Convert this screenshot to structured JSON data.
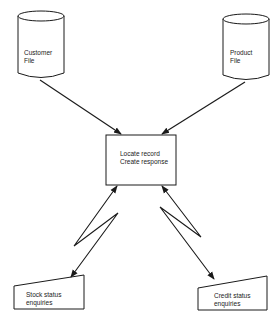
{
  "diagram": {
    "type": "data-flow",
    "nodes": {
      "customer_file": {
        "shape": "cylinder",
        "line1": "Customer",
        "line2": "File"
      },
      "product_file": {
        "shape": "cylinder",
        "line1": "Product",
        "line2": "File"
      },
      "process": {
        "shape": "rectangle",
        "line1": "Locate record",
        "line2": "Create response"
      },
      "stock_enquiries": {
        "shape": "manual-input",
        "line1": "Stock status",
        "line2": "enquiries"
      },
      "credit_enquiries": {
        "shape": "manual-input",
        "line1": "Credit status",
        "line2": "enquiries"
      }
    },
    "edges": [
      {
        "from": "customer_file",
        "to": "process",
        "style": "arrow"
      },
      {
        "from": "product_file",
        "to": "process",
        "style": "arrow"
      },
      {
        "from": "process",
        "to": "stock_enquiries",
        "style": "bidirectional-lightning"
      },
      {
        "from": "process",
        "to": "credit_enquiries",
        "style": "bidirectional-lightning"
      }
    ],
    "colors": {
      "stroke": "#1a1a1a",
      "background": "#ffffff"
    }
  }
}
